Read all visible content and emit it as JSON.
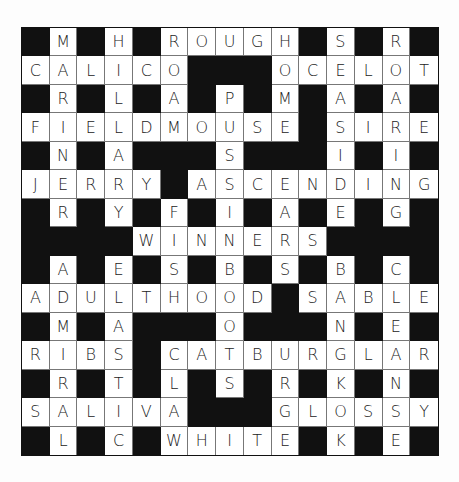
{
  "puzzle": {
    "type": "crossword",
    "size": {
      "rows": 15,
      "cols": 15
    },
    "colors": {
      "block": "#111111",
      "cell": "#ffffff",
      "letter": "#222222",
      "cell_border": "#777777"
    },
    "grid": [
      "#M#H#ROUGH#S#R#",
      "CALICO###OCELOT",
      "#R#L#A#P#M#A#A#",
      "FIELDMOUSE#SIRE",
      "#N#A###S###I#I#",
      "JERRY#ASCENDING",
      "#R#Y#F#I#A#E#G#",
      "####WINNERS####",
      "#A#E#S#B#S#B#C#",
      "ADULTHOOD#SABLE",
      "#M#A###O###N#E#",
      "RIBS#CATBURGLAR",
      "#R#T#L#S#R#K#N#",
      "SALIVA###GLOSSY",
      "#L#C#WHITE#K#E#"
    ],
    "across": [
      {
        "row": 0,
        "col": 5,
        "answer": "ROUGH"
      },
      {
        "row": 1,
        "col": 0,
        "answer": "CALICO"
      },
      {
        "row": 1,
        "col": 9,
        "answer": "OCELOT"
      },
      {
        "row": 3,
        "col": 0,
        "answer": "FIELDMOUSE"
      },
      {
        "row": 3,
        "col": 11,
        "answer": "SIRE"
      },
      {
        "row": 5,
        "col": 0,
        "answer": "JERRY"
      },
      {
        "row": 5,
        "col": 6,
        "answer": "ASCENDING"
      },
      {
        "row": 7,
        "col": 4,
        "answer": "WINNERS"
      },
      {
        "row": 9,
        "col": 0,
        "answer": "ADULTHOOD"
      },
      {
        "row": 9,
        "col": 10,
        "answer": "SABLE"
      },
      {
        "row": 11,
        "col": 0,
        "answer": "RIBS"
      },
      {
        "row": 11,
        "col": 5,
        "answer": "CATBURGLAR"
      },
      {
        "row": 13,
        "col": 0,
        "answer": "SALIVA"
      },
      {
        "row": 13,
        "col": 9,
        "answer": "GLOSSY"
      },
      {
        "row": 14,
        "col": 5,
        "answer": "WHITE"
      }
    ],
    "down": [
      {
        "row": 0,
        "col": 1,
        "answer": "MARFINERY"
      },
      {
        "row": 0,
        "col": 3,
        "answer": "HILLARY"
      },
      {
        "row": 0,
        "col": 11,
        "answer": "SEASIDE"
      },
      {
        "row": 0,
        "col": 13,
        "answer": "ROARING"
      },
      {
        "row": 1,
        "col": 5,
        "answer": "OAM"
      },
      {
        "row": 1,
        "col": 9,
        "answer": "OME"
      },
      {
        "row": 2,
        "col": 7,
        "answer": "PUSSINBOOTS"
      },
      {
        "row": 8,
        "col": 1,
        "answer": "ADMIRAL"
      },
      {
        "row": 8,
        "col": 3,
        "answer": "ELASTIC"
      },
      {
        "row": 8,
        "col": 11,
        "answer": "BANGKOK"
      },
      {
        "row": 8,
        "col": 13,
        "answer": "CLEANSE"
      }
    ]
  }
}
